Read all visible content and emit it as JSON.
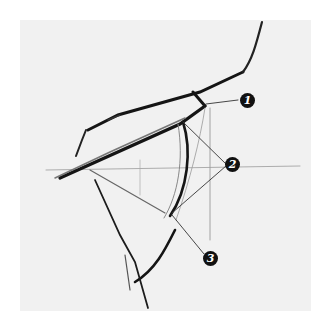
{
  "figure": {
    "background": "#f1f1f1",
    "stroke_color": "#1a1a1a",
    "annotations": [
      {
        "id": "1",
        "label": "1",
        "x": 247,
        "y": 100
      },
      {
        "id": "2",
        "label": "2",
        "x": 232,
        "y": 164
      },
      {
        "id": "3",
        "label": "3",
        "x": 210,
        "y": 258
      }
    ]
  }
}
